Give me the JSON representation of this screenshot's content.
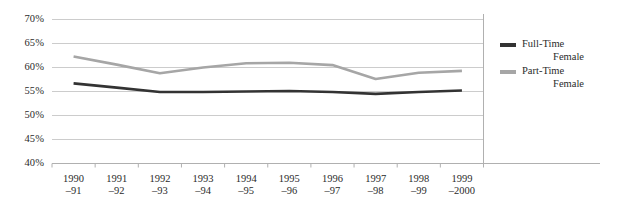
{
  "chart_data": {
    "type": "line",
    "title": "",
    "xlabel": "",
    "ylabel": "",
    "ylim": [
      40,
      70
    ],
    "ytick_values": [
      70,
      65,
      60,
      55,
      50,
      45,
      40
    ],
    "ytick_labels": [
      "70%",
      "65%",
      "60%",
      "55%",
      "50%",
      "45%",
      "40%"
    ],
    "grid": true,
    "legend_position": "right",
    "categories": [
      "1990–91",
      "1991–92",
      "1992–93",
      "1993–94",
      "1994–95",
      "1995–96",
      "1996–97",
      "1997–98",
      "1998–99",
      "1999–2000"
    ],
    "category_lines": [
      {
        "l1": "1990",
        "l2": "–91"
      },
      {
        "l1": "1991",
        "l2": "–92"
      },
      {
        "l1": "1992",
        "l2": "–93"
      },
      {
        "l1": "1993",
        "l2": "–94"
      },
      {
        "l1": "1994",
        "l2": "–95"
      },
      {
        "l1": "1995",
        "l2": "–96"
      },
      {
        "l1": "1996",
        "l2": "–97"
      },
      {
        "l1": "1997",
        "l2": "–98"
      },
      {
        "l1": "1998",
        "l2": "–99"
      },
      {
        "l1": "1999",
        "l2": "–2000"
      }
    ],
    "series": [
      {
        "name": "Full-Time Female",
        "legend_l1": "Full-Time",
        "legend_l2": "Female",
        "color": "#333333",
        "values": [
          56.7,
          55.8,
          54.9,
          54.9,
          55.0,
          55.1,
          54.9,
          54.5,
          54.9,
          55.2
        ]
      },
      {
        "name": "Part-Time Female",
        "legend_l1": "Part-Time",
        "legend_l2": "Female",
        "color": "#a6a6a6",
        "values": [
          62.3,
          60.6,
          58.8,
          60.0,
          60.9,
          61.0,
          60.5,
          57.6,
          58.9,
          59.3
        ]
      }
    ]
  },
  "colors": {
    "grid": "#cccccc",
    "axis": "#b0b0b0",
    "text": "#2b2b2b",
    "full_time": "#333333",
    "part_time": "#a6a6a6"
  }
}
